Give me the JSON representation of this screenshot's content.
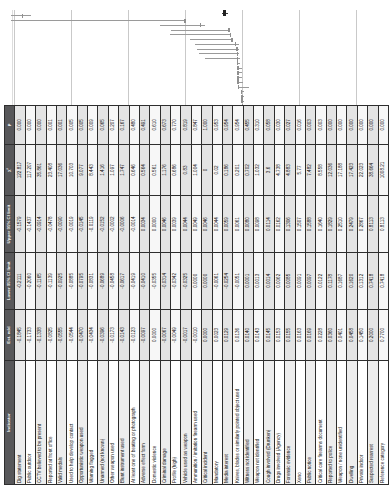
{
  "chart_data": {
    "type": "scatter",
    "title": "",
    "xlabel": "",
    "ylabel": "",
    "ylim": [
      -0.4,
      0.8
    ],
    "yticks": [
      "0.8",
      "0.6",
      "0.4",
      "0.2",
      "0",
      "-0.2",
      "-0.4"
    ],
    "ytick_values": [
      0.8,
      0.6,
      0.4,
      0.2,
      0,
      -0.2,
      -0.4
    ],
    "grid": true,
    "legend": "none",
    "error_bars": "95% CI",
    "reference_point": {
      "label": "Reference category",
      "value": 0.06
    },
    "points": [
      {
        "value": -0.1845,
        "lo": -0.2111,
        "hi": -0.1579
      },
      {
        "value": -0.1733,
        "lo": -0.206,
        "hi": -0.1437
      },
      {
        "value": -0.1338,
        "lo": -0.1165,
        "hi": -0.0914
      },
      {
        "value": -0.0825,
        "lo": -0.1139,
        "hi": -0.0478
      },
      {
        "value": -0.0555,
        "lo": -0.0925,
        "hi": -0.009
      },
      {
        "value": -0.0544,
        "lo": -0.0885,
        "hi": -0.0019
      },
      {
        "value": -0.047,
        "lo": -0.0795,
        "hi": -0.0145
      },
      {
        "value": -0.0434,
        "lo": -0.0831,
        "hi": -0.0119
      },
      {
        "value": -0.0396,
        "lo": -0.0689,
        "hi": -0.0152
      },
      {
        "value": -0.0173,
        "lo": -0.0458,
        "hi": -0.0002
      },
      {
        "value": -0.0143,
        "lo": -0.0617,
        "hi": -0.0006
      },
      {
        "value": -0.0123,
        "lo": -0.0419,
        "hi": -0.0014
      },
      {
        "value": -0.0097,
        "lo": -0.041,
        "hi": 0.0034
      },
      {
        "value": 0.0,
        "lo": -0.0355,
        "hi": 0.0
      },
      {
        "value": -0.0067,
        "lo": -0.0314,
        "hi": 0.0046
      },
      {
        "value": -0.0049,
        "lo": -0.0342,
        "hi": 0.0039
      },
      {
        "value": -0.0017,
        "lo": -0.0325,
        "hi": 0.0044
      },
      {
        "value": -0.001,
        "lo": 0.0,
        "hi": 0.0049
      },
      {
        "value": 0.0,
        "lo": 0.0,
        "hi": 0.0046
      },
      {
        "value": 0.0023,
        "lo": -0.0061,
        "hi": 0.0044
      },
      {
        "value": 0.0129,
        "lo": -0.0254,
        "hi": 0.0059
      },
      {
        "value": 0.0136,
        "lo": -0.0051,
        "hi": 0.0061
      },
      {
        "value": 0.014,
        "lo": 0.0001,
        "hi": 0.008
      },
      {
        "value": 0.0143,
        "lo": 0.0013,
        "hi": 0.0098
      },
      {
        "value": 0.0145,
        "lo": 0.0014,
        "hi": 0.0114
      },
      {
        "value": 0.0153,
        "lo": 0.0062,
        "hi": 0.0162
      },
      {
        "value": 0.0155,
        "lo": 0.0085,
        "hi": 0.1306
      },
      {
        "value": 0.0163,
        "lo": 0.0091,
        "hi": 0.1507
      },
      {
        "value": 0.0169,
        "lo": 0.0097,
        "hi": 0.1588
      },
      {
        "value": 0.0228,
        "lo": 0.0122,
        "hi": 0.164
      },
      {
        "value": 0.036,
        "lo": 0.1178,
        "hi": 0.1829
      },
      {
        "value": 0.0401,
        "lo": 0.1687,
        "hi": 0.251
      },
      {
        "value": 0.0458,
        "lo": 0.162,
        "hi": 0.2479
      },
      {
        "value": 0.145,
        "lo": 0.1312,
        "hi": 0.2867
      },
      {
        "value": 0.2,
        "lo": 0.7418,
        "hi": 0.8113
      },
      {
        "value": 0.77,
        "lo": 0.7418,
        "hi": 0.8113
      }
    ]
  },
  "table": {
    "headers": {
      "indicator": "Indicator",
      "estimate": "Est. ndd",
      "lower": "Lower 95% CI limit",
      "upper": "Upper 95% CI limit",
      "chi": "χ²",
      "p": "p"
    },
    "rows": [
      [
        "Dig statement",
        "-0.1845",
        "-0.2111",
        "-0.1579",
        "122.817",
        "0.000"
      ],
      [
        "Public outdoor",
        "-0.1733",
        "-0.2060",
        "-0.1437",
        "117.207",
        "0.000"
      ],
      [
        "CCTV believed to be present",
        "-0.1338",
        "-0.1165",
        "-0.0914",
        "35.861",
        "0.000"
      ],
      [
        "Reported at front office",
        "-0.0825",
        "-0.1139",
        "-0.0478",
        "23.408",
        "0.001"
      ],
      [
        "Valid medals",
        "-0.0555",
        "-0.0925",
        "-0.0090",
        "17.036",
        "0.001"
      ],
      [
        "Used to help develop contact",
        "-0.0544",
        "-0.0885",
        "-0.0019",
        "10.703",
        "0.005"
      ],
      [
        "Opportunistic weapon used",
        "-0.0470",
        "-0.0795",
        "-0.0145",
        "9.077",
        "0.005"
      ],
      [
        "Warning flagged",
        "-0.0434",
        "-0.0831",
        "-0.0119",
        "8.443",
        "0.009"
      ],
      [
        "Unarmed (not known)",
        "-0.0396",
        "-0.0689",
        "-0.0152",
        "1.416",
        "0.065"
      ],
      [
        "Other weapon used",
        "-0.0173",
        "-0.0458",
        "-0.0002",
        "1.097",
        "0.207"
      ],
      [
        "Blunt instrument used",
        "-0.0143",
        "-0.0617",
        "-0.0006",
        "1.747",
        "0.167"
      ],
      [
        "At least one of beating or photograph",
        "-0.0123",
        "-0.0419",
        "-0.0014",
        "0.646",
        "0.480"
      ],
      [
        "Adverse effect form",
        "-0.0097",
        "-0.0410",
        "0.0034",
        "0.564",
        "0.491"
      ],
      [
        "Domestic violence",
        "0.0000",
        "-0.0355",
        "0.0000",
        "0.561",
        "0.610"
      ],
      [
        "Criminal damage",
        "-0.0067",
        "-0.0314",
        "0.0046",
        "1.176",
        "0.673"
      ],
      [
        "Profile (high)",
        "-0.0049",
        "-0.0342",
        "0.0039",
        "0.686",
        "0.770"
      ],
      [
        "Vehicle used as weapon",
        "-0.0017",
        "-0.0325",
        "0.0044",
        "0.83",
        "0.819"
      ],
      [
        "Ammunition / imitation firearm used",
        "-0.0010",
        "0.0000",
        "0.0049",
        "1.004",
        "0.847"
      ],
      [
        "Critical incident",
        "0.0000",
        "0.0000",
        "0.0046",
        "0",
        "1.000"
      ],
      [
        "Mandatory",
        "0.0023",
        "-0.0061",
        "0.0044",
        "0.02",
        "0.953"
      ],
      [
        "Media interest",
        "0.0129",
        "-0.0254",
        "0.0059",
        "0.186",
        "0.954"
      ],
      [
        "Knives, blades or similarly pointed object used",
        "0.0136",
        "-0.0051",
        "0.0061",
        "0.201",
        "0.954"
      ],
      [
        "Witness not identified",
        "0.0140",
        "0.0001",
        "0.0080",
        "0.702",
        "0.455"
      ],
      [
        "Weapon not identified",
        "0.0143",
        "0.0013",
        "0.0098",
        "1.032",
        "0.310"
      ],
      [
        "Cough involved (Drunken)",
        "0.0145",
        "0.0014",
        "0.0114",
        "3.6",
        "0.058"
      ],
      [
        "Drugs involved (Agency)",
        "0.0153",
        "0.0062",
        "0.0162",
        "4.738",
        "0.030"
      ],
      [
        "Forensic evidence",
        "0.0155",
        "0.0085",
        "0.1306",
        "4.883",
        "0.027"
      ],
      [
        "Xeno",
        "0.0163",
        "0.0091",
        "0.1507",
        "5.77",
        "0.016"
      ],
      [
        "Public notice",
        "0.0169",
        "0.0097",
        "0.1588",
        "7.482",
        "0.003"
      ],
      [
        "Critical care firearms document",
        "0.0228",
        "0.0122",
        "0.1640",
        "8.558",
        "0.003"
      ],
      [
        "Reported to police",
        "0.0360",
        "0.1178",
        "0.1829",
        "12.036",
        "0.000"
      ],
      [
        "Weapon / none unidentified",
        "0.0401",
        "0.1687",
        "0.2510",
        "17.188",
        "0.000"
      ],
      [
        "Dwelling",
        "0.0458",
        "0.1620",
        "0.2479",
        "17.423",
        "0.000"
      ],
      [
        "Private indoor",
        "0.1450",
        "0.1312",
        "0.2867",
        "22.023",
        "0.000"
      ],
      [
        "Suspected rearrest",
        "0.2000",
        "0.7418",
        "0.8113",
        "38.664",
        "0.000"
      ],
      [
        "Reference category",
        "0.7700",
        "0.7418",
        "0.8113",
        "1008.21",
        "0.000"
      ]
    ]
  }
}
